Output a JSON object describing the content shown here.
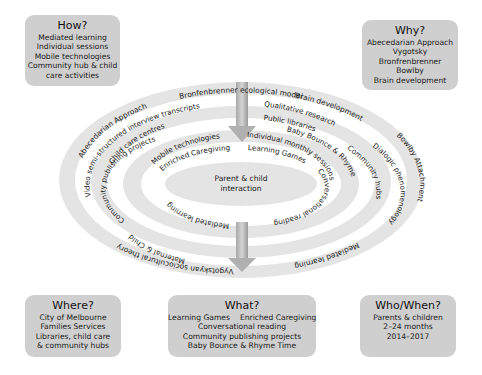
{
  "boxes": {
    "how": {
      "title": "How?",
      "lines": [
        "Mediated learning",
        "Individual sessions",
        "Mobile technologies",
        "Community hub & child",
        "care activities"
      ]
    },
    "why": {
      "title": "Why?",
      "lines": [
        "Abecedarian Approach",
        "Vygotsky",
        "Bronfrenbrenner",
        "Bowlby",
        "Brain development"
      ]
    },
    "where": {
      "title": "Where?",
      "lines": [
        "City of Melbourne",
        "Families Services",
        "Libraries, child care",
        "& community hubs"
      ]
    },
    "what": {
      "title": "What?",
      "row1": [
        "Learning Games",
        "Enriched Caregiving"
      ],
      "lines": [
        "Conversational reading",
        "Community publishing projects",
        "Baby Bounce & Rhyme Time"
      ]
    },
    "who_when": {
      "title": "Who/When?",
      "lines": [
        "Parents & children",
        "2–24 months",
        "2014–2017"
      ]
    }
  },
  "rings": {
    "center": {
      "line1": "Parent & child",
      "line2": "interaction"
    },
    "ring1": {
      "top_left": "Enriched Caregiving",
      "top_right": "Learning Games",
      "right": "Conversational reading",
      "bottom_left": "Mediated learning"
    },
    "ring2": {
      "top_left": "Mobile technologies",
      "top_right": "Individual monthly sessions"
    },
    "ring3": {
      "top_left": "Community publishing projects",
      "top_right": "Baby Bounce & Rhyme Time",
      "left_lower": "Maternal & Child"
    },
    "ring4": {
      "top_left": "Child care centres",
      "top_right": "Public libraries",
      "right": "Community hubs"
    },
    "ring5": {
      "top_left": "Video semi-structured interview transcripts",
      "top_right": "Qualitative research",
      "right": "Dialogic phenomenology"
    },
    "ring6": {
      "top": "Bronfenbrenner ecological model",
      "top_left": "Abecedarian Approach",
      "top_right": "Brain development",
      "right": "Bowlby Attachment",
      "bottom_left": "Vygotskyan sociocultural theory",
      "bottom_right": "Mediated learning"
    }
  },
  "colors": {
    "box_fill": "#cfcfcf",
    "ring_fill": "#e6e6e6",
    "arrow_fill": "#bdbdbd"
  }
}
